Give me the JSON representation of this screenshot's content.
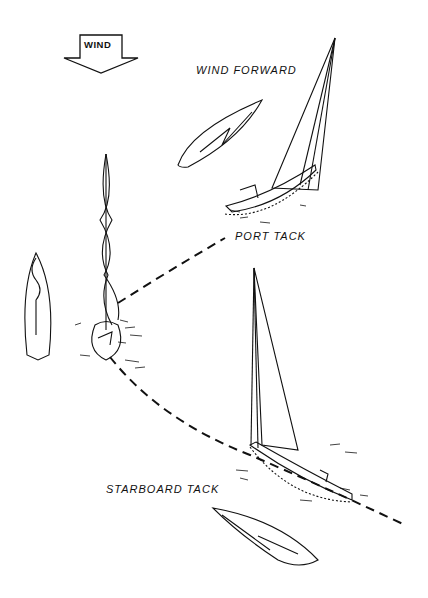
{
  "diagram": {
    "wind_indicator": {
      "label": "WIND",
      "direction": "down",
      "icon": "down-arrow-icon"
    },
    "labels": {
      "wind_forward": "WIND FORWARD",
      "port_tack": "PORT TACK",
      "starboard_tack": "STARBOARD TACK"
    },
    "colors": {
      "ink": "#111111",
      "background": "#ffffff"
    }
  }
}
